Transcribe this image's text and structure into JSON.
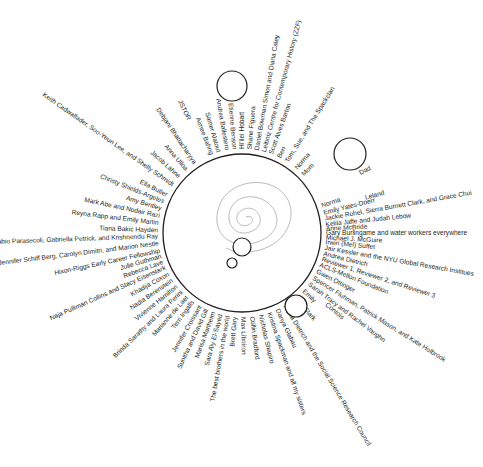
{
  "diagram": {
    "type": "radial-acknowledgments",
    "center": {
      "x": 242,
      "y": 233,
      "radius": 79
    },
    "colors": {
      "ink": "#231f20",
      "spiral": "#a7a9ac",
      "background": "#ffffff"
    },
    "thought_bubbles": [
      {
        "name": "large-bubble",
        "cx": 242,
        "cy": 247,
        "r": 9
      },
      {
        "name": "small-bubble",
        "cx": 232,
        "cy": 263,
        "r": 5
      }
    ],
    "satellite_circles": [
      {
        "name": "top-circle",
        "cx": 232,
        "cy": 86,
        "r": 15
      },
      {
        "name": "family-circle",
        "cx": 350,
        "cy": 154,
        "r": 16
      },
      {
        "name": "lower-right-circle",
        "cx": 296,
        "cy": 306,
        "r": 11
      }
    ],
    "labels": [
      {
        "text": "Emily Yates-Doerr",
        "angle": -14
      },
      {
        "text": "Jackie Rohel, Sierra Burnett Clark, and Grace Choi",
        "angle": -10
      },
      {
        "text": "Kelila Jaffe and Judah Lebow",
        "angle": -6
      },
      {
        "text": "Anne McBride",
        "angle": -3
      },
      {
        "text": "Gary Burlingame and water workers everywhere",
        "angle": 0
      },
      {
        "text": "Michael J. McGuire",
        "angle": 3
      },
      {
        "text": "Irwin (Mel) Suffet",
        "angle": 6
      },
      {
        "text": "Jair Kessler and the NYU Global Research Institues",
        "angle": 10
      },
      {
        "text": "Andrea Dietrich",
        "angle": 14
      },
      {
        "text": "Reviewer 1, Reviewer 2, and Reviewer 3",
        "angle": 18
      },
      {
        "text": "ACLS-Mellon Foundation",
        "angle": 22
      },
      {
        "text": "Gwen Ottinger",
        "angle": 27
      },
      {
        "text": "Spencer Fluhman, Patrick Mason, and Kate Holbrook",
        "angle": 32
      },
      {
        "text": "Sarah Tracy and Rachel Vaughn",
        "angle": 37
      },
      {
        "text": "Emily",
        "angle": 43
      },
      {
        "text": "Luke",
        "angle": 52
      },
      {
        "text": "Alexa Dietrich and the Social Science Research Council",
        "angle": 59
      },
      {
        "text": "Danya Glabau",
        "angle": 65
      },
      {
        "text": "Kristina Spackman and all my sisters",
        "angle": 71
      },
      {
        "text": "Nicholas Shapiro",
        "angle": 77
      },
      {
        "text": "Collin Bradford",
        "angle": 83
      },
      {
        "text": "Max Liboiron",
        "angle": 89
      },
      {
        "text": "Brett Gary",
        "angle": 95
      },
      {
        "text": "The best brothers in the world",
        "angle": 100
      },
      {
        "text": "Sara Aly El-Sayed",
        "angle": 105
      },
      {
        "text": "Marisa Manheim",
        "angle": 110
      },
      {
        "text": "Sunitha and David Gill",
        "angle": 115
      },
      {
        "text": "Jennifer Croissant",
        "angle": 120
      },
      {
        "text": "Terri Ingalls",
        "angle": 126
      },
      {
        "text": "Marianne de Laet",
        "angle": 131
      },
      {
        "text": "Brinda Sarathy and Laura Perini",
        "angle": 136
      },
      {
        "text": "Vivienne Hamilton",
        "angle": 141
      },
      {
        "text": "Nadia Berenstein",
        "angle": 146
      },
      {
        "text": "Khadija Coxon",
        "angle": 151
      },
      {
        "text": "Naja Pulliman Collins and Stacy Eisenstark",
        "angle": 156
      },
      {
        "text": "Rebecca Lave",
        "angle": 160
      },
      {
        "text": "Julie Guthman",
        "angle": 164
      },
      {
        "text": "Hixon-Riggs Early Career Fellowship",
        "angle": 168
      },
      {
        "text": "Jennifer Schiff Berg, Carolyn Dimitri, and Marion Nestle",
        "angle": 173
      },
      {
        "text": "Fabio Parasecoli, Gabriella Petrick, and Krishnendu Ray",
        "angle": 178
      },
      {
        "text": "Tiana Bakic Hayden",
        "angle": 182
      },
      {
        "text": "Reyna Rapp and Emily Martin",
        "angle": 187
      },
      {
        "text": "Mark Abe and Nodair Razi",
        "angle": 192
      },
      {
        "text": "Amy Bentley",
        "angle": 197
      },
      {
        "text": "Christy Shields-Argeles",
        "angle": 202
      },
      {
        "text": "Ella Butler",
        "angle": 207
      },
      {
        "text": "Keith Cadwallader, Soo-Yeun Lee, and Shelly Schmidt",
        "angle": 215
      },
      {
        "text": "Jacob Lahne",
        "angle": 222
      },
      {
        "text": "Anna Ulloa",
        "angle": 229
      },
      {
        "text": "Debjani Bhattacharyya",
        "angle": 236
      },
      {
        "text": "JSTOR",
        "angle": 245,
        "offset": 125
      },
      {
        "text": "Aimee Bahng",
        "angle": 249
      },
      {
        "text": "Samer Alatout",
        "angle": 254
      },
      {
        "text": "Andrea Ballestero",
        "angle": 260
      },
      {
        "text": "Etienne Benson",
        "angle": 265
      },
      {
        "text": "Hi'ilei Hobart",
        "angle": 270
      },
      {
        "text": "Shane Figuera",
        "angle": 275
      },
      {
        "text": "Daniel Bowman Simon and Diana Caley",
        "angle": 280
      },
      {
        "text": "Leibniz Centre for Contemporary History (ZZF)",
        "angle": 285
      },
      {
        "text": "Scott Alves Barton",
        "angle": 290
      },
      {
        "text": "Ben",
        "angle": 296
      },
      {
        "text": "Tom, Sue, and The Spackclan",
        "angle": 302
      },
      {
        "text": "Norma",
        "angle": 310
      },
      {
        "text": "Mom",
        "angle": 316
      },
      {
        "text": "Norma",
        "angle": 341
      },
      {
        "text": "Wayne",
        "angle": 322,
        "offset": 118
      },
      {
        "text": "Dad",
        "angle": 333,
        "offset": 132
      },
      {
        "text": "Leland",
        "angle": 344,
        "offset": 128
      },
      {
        "text": "Contois",
        "angle": 40,
        "offset": 110
      },
      {
        "text": "Stark",
        "angle": 50,
        "offset": 98
      }
    ]
  }
}
